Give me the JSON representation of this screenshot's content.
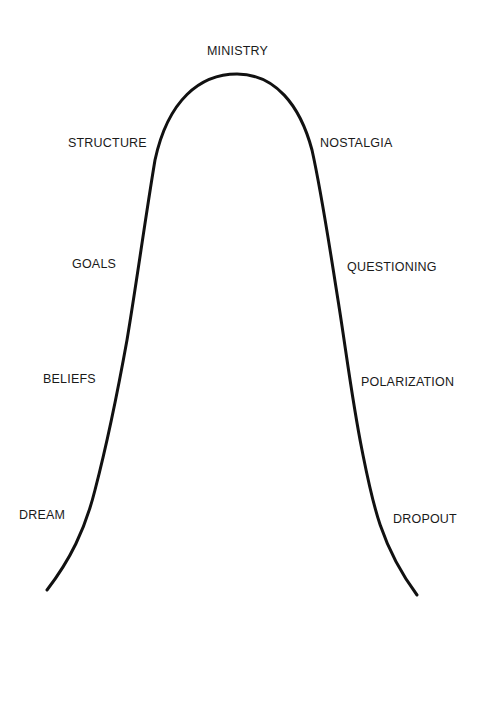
{
  "diagram": {
    "type": "bell-curve",
    "curve_color": "#111111",
    "peak": {
      "label": "MINISTRY"
    },
    "ascending": [
      {
        "label": "DREAM"
      },
      {
        "label": "BELIEFS"
      },
      {
        "label": "GOALS"
      },
      {
        "label": "STRUCTURE"
      }
    ],
    "descending": [
      {
        "label": "NOSTALGIA"
      },
      {
        "label": "QUESTIONING"
      },
      {
        "label": "POLARIZATION"
      },
      {
        "label": "DROPOUT"
      }
    ]
  }
}
